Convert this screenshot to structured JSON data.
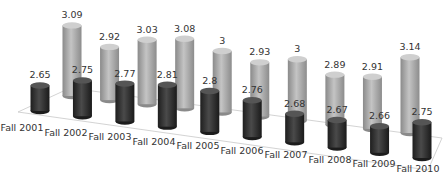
{
  "chart_data": {
    "type": "bar",
    "subtype": "3d-cylinder",
    "title": "",
    "xlabel": "",
    "ylabel": "",
    "legend": null,
    "grid": false,
    "categories": [
      "Fall 2001",
      "Fall 2002",
      "Fall 2003",
      "Fall 2004",
      "Fall 2005",
      "Fall 2006",
      "Fall 2007",
      "Fall 2008",
      "Fall 2009",
      "Fall 2010"
    ],
    "series": [
      {
        "name": "Front series",
        "color": "#3a3a3a",
        "values": [
          2.65,
          2.75,
          2.77,
          2.81,
          2.8,
          2.76,
          2.68,
          2.67,
          2.66,
          2.75
        ],
        "labels": [
          "2.65",
          "2.75",
          "2.77",
          "2.81",
          "2.8",
          "2.76",
          "2.68",
          "2.67",
          "2.66",
          "2.75"
        ]
      },
      {
        "name": "Back series",
        "color": "#a9a9a9",
        "values": [
          3.09,
          2.92,
          3.03,
          3.08,
          3,
          2.93,
          3,
          2.89,
          2.91,
          3.14
        ],
        "labels": [
          "3.09",
          "2.92",
          "3.03",
          "3.08",
          "3",
          "2.93",
          "3",
          "2.89",
          "2.91",
          "3.14"
        ]
      }
    ],
    "ylim": [
      2.4,
      3.2
    ]
  }
}
